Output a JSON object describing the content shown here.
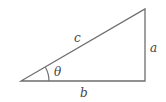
{
  "diagram": {
    "type": "right-triangle",
    "labels": {
      "hypotenuse": "c",
      "opposite": "a",
      "adjacent": "b",
      "angle": "θ"
    },
    "colors": {
      "stroke": "#6e6e6e",
      "text": "#444444"
    }
  }
}
